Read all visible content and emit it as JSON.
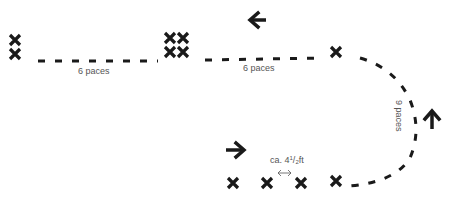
{
  "diagram": {
    "colors": {
      "ink": "#1a1a1a",
      "label": "#555555",
      "background": "#ffffff"
    },
    "labels": {
      "segment1": "6 paces",
      "segment2": "6 paces",
      "segment3": "9 paces",
      "spacing_prefix": "ca. 4",
      "spacing_sup": "1",
      "spacing_slash": "/",
      "spacing_sub": "2",
      "spacing_unit": "ft"
    },
    "icons": {
      "arrow_top": "arrow-left",
      "arrow_right": "arrow-up",
      "arrow_bottom": "arrow-right",
      "spacing": "double-arrow-horizontal",
      "marker": "cross-x"
    },
    "markers": {
      "group_left": 2,
      "group_middle": 4,
      "single_top_right": 1,
      "bottom_row": 4
    }
  }
}
